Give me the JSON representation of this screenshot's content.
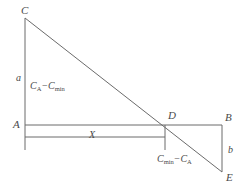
{
  "figure": {
    "background_color": "#ffffff",
    "line_color": "#6b6b6b",
    "text_color": "#4a4a4a",
    "vertices": [
      {
        "id": "C",
        "label": "C",
        "x": 25,
        "y": 18
      },
      {
        "id": "A",
        "label": "A",
        "x": 25,
        "y": 125
      },
      {
        "id": "B",
        "label": "B",
        "x": 222,
        "y": 125
      },
      {
        "id": "D",
        "label": "D",
        "x": 165,
        "y": 125
      },
      {
        "id": "E",
        "label": "E",
        "x": 222,
        "y": 172
      }
    ],
    "dimensions": [
      {
        "id": "a",
        "label": "a",
        "description": "vertical-segment-C-to-A"
      },
      {
        "id": "b",
        "label": "b",
        "description": "vertical-segment-B-to-E"
      },
      {
        "id": "X",
        "label": "X",
        "description": "horizontal-segment-A-to-D"
      }
    ],
    "expressions": [
      {
        "id": "top",
        "text": "C_A − C_min",
        "term1_base": "C",
        "term1_sub": "A",
        "operator": "−",
        "term2_base": "C",
        "term2_sub": "min"
      },
      {
        "id": "bottom",
        "text": "C_min − C_A",
        "term1_base": "C",
        "term1_sub": "min",
        "operator": "−",
        "term2_base": "C",
        "term2_sub": "A"
      }
    ]
  }
}
